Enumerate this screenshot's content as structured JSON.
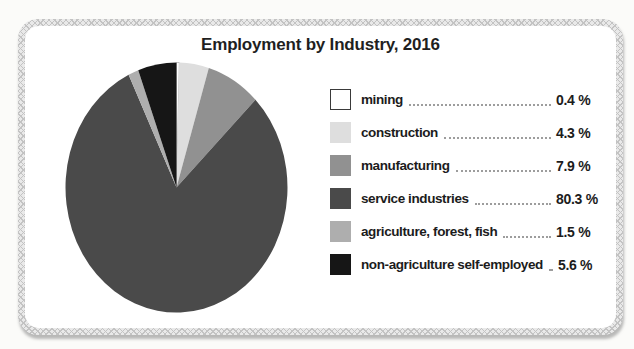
{
  "chart_data": {
    "type": "pie",
    "title": "Employment by Industry, 2016",
    "start_angle_deg": 0,
    "direction": "clockwise",
    "legend_position": "right",
    "categories": [
      "mining",
      "construction",
      "manufacturing",
      "service industries",
      "agriculture, forest, fish",
      "non-agriculture self-employed"
    ],
    "values": [
      0.4,
      4.3,
      7.9,
      80.3,
      1.5,
      5.6
    ],
    "value_labels": [
      "0.4 %",
      "4.3 %",
      "7.9 %",
      "80.3 %",
      "1.5 %",
      "5.6 %"
    ],
    "colors": [
      "#ffffff",
      "#dedede",
      "#919191",
      "#4a4a4a",
      "#aeaeae",
      "#161616"
    ],
    "mining_swatch_border_color": "#3a3a3a"
  }
}
